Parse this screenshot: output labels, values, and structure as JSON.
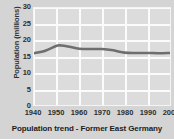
{
  "chart_data": {
    "type": "line",
    "title": "Population trend - Former East Germany",
    "xlabel": "",
    "ylabel": "Population (millions)",
    "xlim": [
      1940,
      2000
    ],
    "ylim": [
      0,
      30
    ],
    "xticks": [
      "1940",
      "1950",
      "1960",
      "1970",
      "1980",
      "1990",
      "2000"
    ],
    "yticks": [
      "0",
      "5",
      "10",
      "15",
      "20",
      "25",
      "30"
    ],
    "grid": true,
    "legend": false,
    "line_color": "#6e6e6e",
    "plot_background": "#dcdcdc",
    "figure_background": "#d4d4d4",
    "series": [
      {
        "name": "Population",
        "x": [
          1940,
          1945,
          1950,
          1952,
          1955,
          1960,
          1965,
          1970,
          1975,
          1980,
          1985,
          1990,
          1995,
          2000
        ],
        "values": [
          16.0,
          16.8,
          18.3,
          18.4,
          18.1,
          17.4,
          17.3,
          17.3,
          16.9,
          16.2,
          16.1,
          16.1,
          16.0,
          16.1
        ]
      }
    ]
  }
}
